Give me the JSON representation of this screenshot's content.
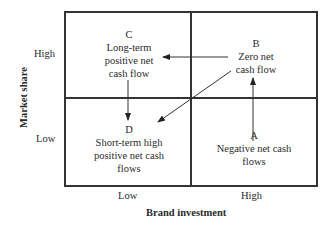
{
  "diagram": {
    "type": "2x2 matrix",
    "x_axis": {
      "title": "Brand investment",
      "ticks": [
        "Low",
        "High"
      ]
    },
    "y_axis": {
      "title": "Market share",
      "ticks": [
        "High",
        "Low"
      ]
    },
    "quadrants": {
      "C": {
        "letter": "C",
        "lines": [
          "Long-term",
          "positive net",
          "cash flow"
        ],
        "position": "top-left"
      },
      "B": {
        "letter": "B",
        "lines": [
          "Zero net",
          "cash flow"
        ],
        "position": "top-right"
      },
      "D": {
        "letter": "D",
        "lines": [
          "Short-term high",
          "positive net cash",
          "flows"
        ],
        "position": "bottom-left"
      },
      "A": {
        "letter": "A",
        "lines": [
          "Negative net cash",
          "flows"
        ],
        "position": "bottom-right"
      }
    },
    "arrows": [
      {
        "from": "A",
        "to": "B",
        "direction": "up"
      },
      {
        "from": "B",
        "to": "C",
        "direction": "left"
      },
      {
        "from": "B",
        "to": "D",
        "direction": "diagonal down-left"
      },
      {
        "from": "C",
        "to": "D",
        "direction": "down"
      }
    ],
    "colors": {
      "line": "#333333",
      "text": "#2a2a2a",
      "background": "#ffffff"
    }
  }
}
